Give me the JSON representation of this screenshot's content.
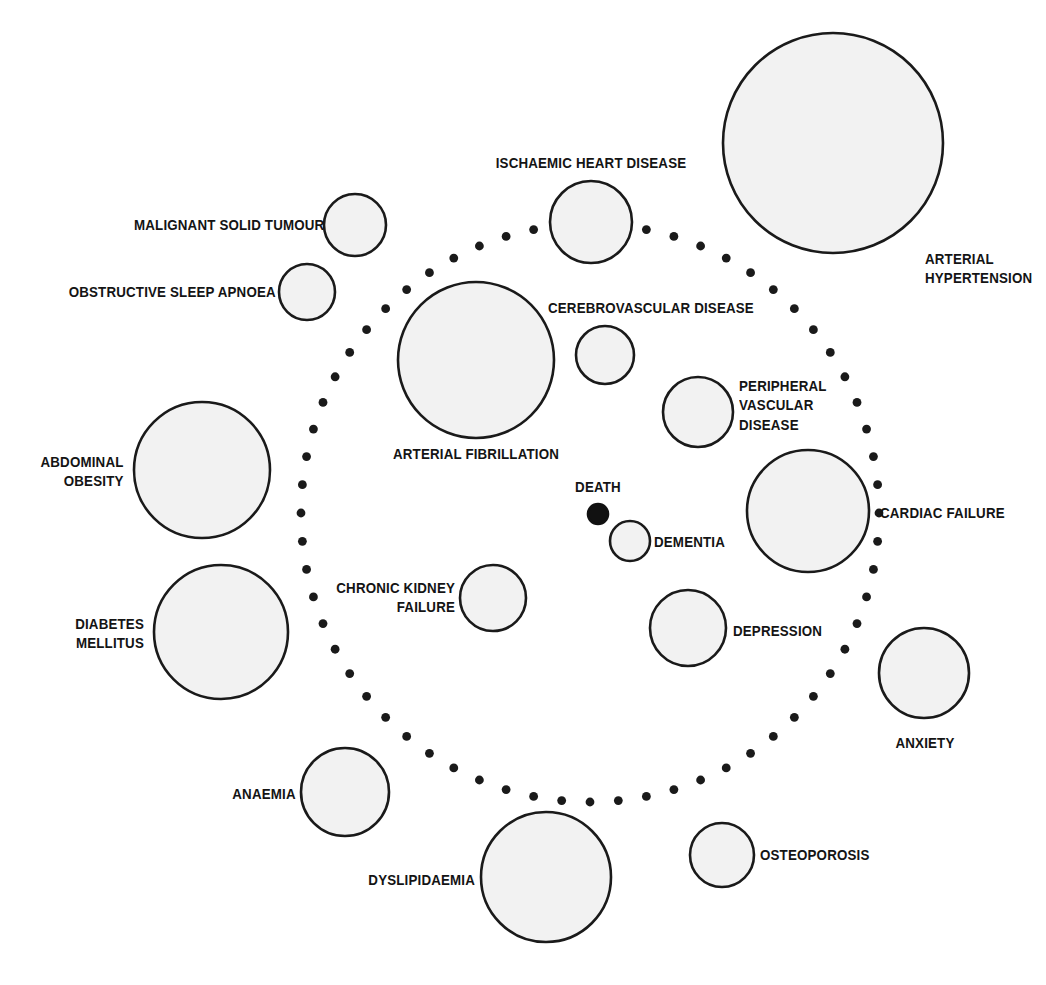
{
  "figure": {
    "kind": "bubble-network-diagram",
    "background_color": "#ffffff",
    "bubble_fill": "#f2f2f2",
    "bubble_stroke": "#1a1a1a",
    "accent_color": "#111111"
  },
  "ring": {
    "name": "dotted-boundary-ring",
    "center_x": 590,
    "center_y": 513,
    "radius": 289,
    "dot_count": 64,
    "dot_radius": 4.4,
    "color": "#1a1a1a"
  },
  "chart_data": {
    "type": "scatter",
    "title": "",
    "xlabel": "",
    "ylabel": "",
    "nodes": [
      {
        "label": "MALIGNANT SOLID TUMOUR",
        "cx": 355,
        "cy": 225,
        "r": 31,
        "filled": false,
        "label_x": 324,
        "label_y": 225,
        "label_align": "right"
      },
      {
        "label": "OBSTRUCTIVE SLEEP APNOEA",
        "cx": 307,
        "cy": 292,
        "r": 28,
        "filled": false,
        "label_x": 276,
        "label_y": 292,
        "label_align": "right"
      },
      {
        "label": "ISCHAEMIC HEART DISEASE",
        "cx": 591,
        "cy": 222,
        "r": 41,
        "filled": false,
        "label_x": 591,
        "label_y": 163,
        "label_align": "center"
      },
      {
        "label": "ARTERIAL HYPERTENSION",
        "cx": 833,
        "cy": 143,
        "r": 110,
        "filled": false,
        "label_x": 925,
        "label_y": 268,
        "label_align": "left"
      },
      {
        "label": "CEREBROVASCULAR DISEASE",
        "cx": 605,
        "cy": 355,
        "r": 29,
        "filled": false,
        "label_x": 548,
        "label_y": 308,
        "label_align": "left"
      },
      {
        "label": "ARTERIAL FIBRILLATION",
        "cx": 476,
        "cy": 360,
        "r": 78,
        "filled": false,
        "label_x": 476,
        "label_y": 454,
        "label_align": "center"
      },
      {
        "label": "PERIPHERAL\nVASCULAR\nDISEASE",
        "cx": 698,
        "cy": 412,
        "r": 35,
        "filled": false,
        "label_x": 739,
        "label_y": 405,
        "label_align": "left"
      },
      {
        "label": "ABDOMINAL\nOBESITY",
        "cx": 202,
        "cy": 470,
        "r": 68,
        "filled": false,
        "label_x": 124,
        "label_y": 471,
        "label_align": "right"
      },
      {
        "label": "CARDIAC FAILURE",
        "cx": 808,
        "cy": 511,
        "r": 61,
        "filled": false,
        "label_x": 880,
        "label_y": 513,
        "label_align": "left"
      },
      {
        "label": "DEATH",
        "cx": 598,
        "cy": 514,
        "r": 10,
        "filled": true,
        "label_x": 598,
        "label_y": 487,
        "label_align": "center"
      },
      {
        "label": "DEMENTIA",
        "cx": 630,
        "cy": 541,
        "r": 20,
        "filled": false,
        "label_x": 654,
        "label_y": 542,
        "label_align": "left"
      },
      {
        "label": "CHRONIC KIDNEY\nFAILURE",
        "cx": 493,
        "cy": 598,
        "r": 33,
        "filled": false,
        "label_x": 455,
        "label_y": 597,
        "label_align": "right"
      },
      {
        "label": "DIABETES\nMELLITUS",
        "cx": 221,
        "cy": 632,
        "r": 67,
        "filled": false,
        "label_x": 144,
        "label_y": 633,
        "label_align": "right"
      },
      {
        "label": "DEPRESSION",
        "cx": 688,
        "cy": 628,
        "r": 38,
        "filled": false,
        "label_x": 733,
        "label_y": 631,
        "label_align": "left"
      },
      {
        "label": "ANXIETY",
        "cx": 924,
        "cy": 673,
        "r": 45,
        "filled": false,
        "label_x": 925,
        "label_y": 743,
        "label_align": "center"
      },
      {
        "label": "ANAEMIA",
        "cx": 345,
        "cy": 792,
        "r": 44,
        "filled": false,
        "label_x": 296,
        "label_y": 794,
        "label_align": "right"
      },
      {
        "label": "DYSLIPIDAEMIA",
        "cx": 546,
        "cy": 877,
        "r": 65,
        "filled": false,
        "label_x": 475,
        "label_y": 880,
        "label_align": "right"
      },
      {
        "label": "OSTEOPOROSIS",
        "cx": 722,
        "cy": 855,
        "r": 32,
        "filled": false,
        "label_x": 760,
        "label_y": 855,
        "label_align": "left"
      }
    ]
  }
}
